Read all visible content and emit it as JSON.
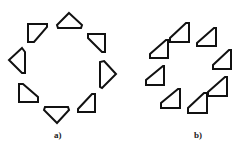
{
  "panels": [
    {
      "label": "a)",
      "label_pos": [
        54,
        130
      ],
      "shapes": [
        {
          "points": "28,24 47,24 47,27 34,42 28,42"
        },
        {
          "points": "22,48 25,52 25,73 22,73 9,60"
        },
        {
          "points": "19,84 23,84 38,97 38,102 19,102"
        },
        {
          "points": "45,107 68,107 69,110 57,123 44,110"
        },
        {
          "points": "95,94 95,112 78,112 78,109 92,94"
        },
        {
          "points": "104,61 116,74 102,88 100,87 100,62"
        },
        {
          "points": "88,34 105,34 105,52 102,52 88,38"
        },
        {
          "points": "69,13 82,25 81,28 58,28 57,25"
        }
      ]
    },
    {
      "label": "b)",
      "label_pos": [
        194,
        130
      ],
      "shapes": [
        {
          "points": "186,23 189,23 189,42 170,42 170,38"
        },
        {
          "points": "166,40 168,40 168,58 150,58 150,54"
        },
        {
          "points": "214,28 216,28 216,46 197,46 197,43"
        },
        {
          "points": "229,50 231,50 231,69 213,69 213,65"
        },
        {
          "points": "163,66 164,66 164,85 146,85 146,80"
        },
        {
          "points": "178,89 180,89 180,108 161,108 161,103"
        },
        {
          "points": "225,77 227,77 227,96 208,96 208,92"
        },
        {
          "points": "204,93 207,93 207,113 188,113 188,108"
        }
      ]
    }
  ],
  "stroke_color": "#111111"
}
